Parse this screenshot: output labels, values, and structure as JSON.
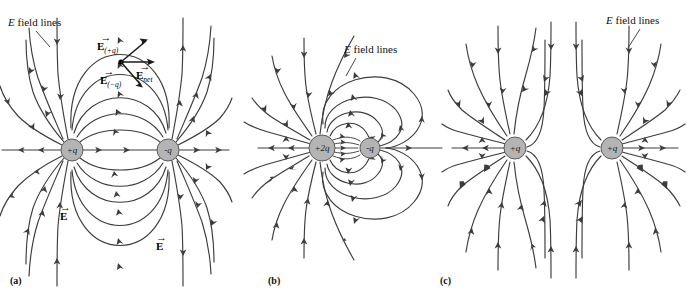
{
  "figure": {
    "title_visible": false,
    "background": "#ffffff",
    "line_color": "#3c3c3c",
    "charge_fill": "#b4b4b4",
    "charge_stroke": "#5a5a5a"
  },
  "panels": [
    {
      "id": "a",
      "caption": "(a)",
      "field_label": "E field lines",
      "field_label_italic_part": "E",
      "field_label_rest": " field lines",
      "charges": [
        {
          "label": "+q",
          "sign": "positive",
          "magnitude": 1,
          "cx": 72,
          "cy": 150,
          "r": 11
        },
        {
          "label": "-q",
          "sign": "negative",
          "magnitude": 1,
          "cx": 168,
          "cy": 150,
          "r": 11
        }
      ],
      "vectors": [
        {
          "name": "E_plus_q",
          "symbol": "E",
          "subscript": "(+q)",
          "label": "E(+q)"
        },
        {
          "name": "E_net",
          "symbol": "E",
          "subscript": "net",
          "label": "Enet"
        },
        {
          "name": "E_minus_q",
          "symbol": "E",
          "subscript": "(-q)",
          "label": "E(-q)"
        }
      ],
      "extra_labels": [
        {
          "name": "E_vector_left",
          "symbol": "E"
        },
        {
          "name": "E_vector_right",
          "symbol": "E"
        }
      ],
      "description": "Electric dipole: equal and opposite charges"
    },
    {
      "id": "b",
      "caption": "(b)",
      "field_label": "E field lines",
      "field_label_italic_part": "E",
      "field_label_rest": " field lines",
      "charges": [
        {
          "label": "+2q",
          "sign": "positive",
          "magnitude": 2,
          "cx": 322,
          "cy": 148,
          "r": 13
        },
        {
          "label": "-q",
          "sign": "negative",
          "magnitude": 1,
          "cx": 370,
          "cy": 148,
          "r": 10
        }
      ],
      "vectors": [],
      "extra_labels": [],
      "description": "Unequal opposite charges: +2q and -q"
    },
    {
      "id": "c",
      "caption": "(c)",
      "field_label": "E field lines",
      "field_label_italic_part": "E",
      "field_label_rest": " field lines",
      "charges": [
        {
          "label": "+q",
          "sign": "positive",
          "magnitude": 1,
          "cx": 515,
          "cy": 148,
          "r": 11
        },
        {
          "label": "+q",
          "sign": "positive",
          "magnitude": 1,
          "cx": 612,
          "cy": 148,
          "r": 11
        }
      ],
      "vectors": [],
      "extra_labels": [],
      "description": "Two like positive charges"
    }
  ]
}
